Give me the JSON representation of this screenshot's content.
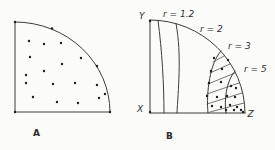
{
  "colors": {
    "background": "#fbfbf9",
    "line": "#3c3c3c",
    "dot": "#1f1f1f",
    "text": "#2b2b2b"
  },
  "figure": {
    "width": 275,
    "height": 150,
    "dot_radius": 1.2,
    "line_width": 1,
    "hatch_width": 0.7,
    "panels": [
      {
        "name": "panel-A",
        "caption": {
          "t": "A",
          "x": 33,
          "y": 136,
          "size": 9,
          "italic": false,
          "caption": true,
          "name": "panel-A-caption"
        },
        "paths": [
          {
            "name": "quarter-region-edges-A",
            "d": "M15,22 L15,112 L110,112"
          },
          {
            "name": "quarter-arc-A",
            "d": "M15,22 A95,90 0 0 1 110,112"
          }
        ],
        "hatch": [],
        "dots": [
          [
            15,
            22
          ],
          [
            52,
            28.5
          ],
          [
            97,
            66
          ],
          [
            15,
            112
          ],
          [
            110,
            112
          ],
          [
            29,
            41
          ],
          [
            44,
            44
          ],
          [
            61,
            43
          ],
          [
            30,
            57
          ],
          [
            81,
            58
          ],
          [
            62,
            64
          ],
          [
            44,
            71
          ],
          [
            26,
            75
          ],
          [
            26,
            83
          ],
          [
            53,
            84
          ],
          [
            75,
            83
          ],
          [
            97,
            85
          ],
          [
            105,
            94
          ],
          [
            33,
            97
          ],
          [
            99,
            98
          ],
          [
            57,
            102
          ],
          [
            78,
            103
          ]
        ],
        "labels": []
      },
      {
        "name": "panel-B",
        "caption": {
          "t": "B",
          "x": 166,
          "y": 139,
          "size": 9,
          "italic": false,
          "caption": true,
          "name": "panel-B-caption"
        },
        "paths": [
          {
            "name": "y-axis-B",
            "d": "M150,20 L150,113"
          },
          {
            "name": "x-axis-B",
            "d": "M150,113 L245,113"
          },
          {
            "name": "quarter-arc-B",
            "d": "M150,20 A95,93 0 0 1 245,113"
          },
          {
            "name": "contour-r-1.2",
            "d": "M158,20.5 C162,50 164,85 164,113"
          },
          {
            "name": "contour-r-2",
            "d": "M176,23.6 C182,55 178,92 177,113"
          },
          {
            "name": "contour-r-3",
            "d": "M221,51 C210,63 206,92 208,113"
          },
          {
            "name": "contour-r-5",
            "d": "M235,71 C226,81 224,101 226,113"
          }
        ],
        "hatch": [
          [
            213,
            62,
            224,
            56
          ],
          [
            210,
            73,
            230,
            64
          ],
          [
            208,
            84,
            235,
            73
          ],
          [
            207,
            94,
            239,
            83
          ],
          [
            207,
            104,
            242,
            93
          ],
          [
            210,
            112,
            244,
            103
          ]
        ],
        "dots": [
          [
            150,
            21
          ],
          [
            150,
            112
          ],
          [
            214,
            58
          ],
          [
            228,
            60
          ],
          [
            211,
            71
          ],
          [
            222,
            69
          ],
          [
            209,
            83
          ],
          [
            221,
            82
          ],
          [
            231,
            86
          ],
          [
            236,
            88
          ],
          [
            207,
            96
          ],
          [
            217,
            97
          ],
          [
            227,
            96
          ],
          [
            235,
            97
          ],
          [
            212,
            106
          ],
          [
            221,
            107
          ],
          [
            230,
            105
          ],
          [
            237,
            107
          ],
          [
            226,
            110
          ],
          [
            234,
            110
          ],
          [
            241,
            110
          ],
          [
            243,
            112
          ]
        ],
        "labels": [
          {
            "t": "Y",
            "x": 139,
            "y": 18.5,
            "size": 9,
            "italic": true,
            "name": "label-Y"
          },
          {
            "t": "X",
            "x": 137,
            "y": 112,
            "size": 9,
            "italic": true,
            "name": "label-X"
          },
          {
            "t": "Z",
            "x": 247.5,
            "y": 117,
            "size": 9,
            "italic": true,
            "name": "label-Z"
          },
          {
            "t": "r = 1.2",
            "x": 163,
            "y": 17,
            "size": 9,
            "italic": true,
            "name": "label-r-1.2"
          },
          {
            "t": "r = 2",
            "x": 200,
            "y": 32,
            "size": 9,
            "italic": true,
            "name": "label-r-2"
          },
          {
            "t": "r = 3",
            "x": 228,
            "y": 49,
            "size": 9,
            "italic": true,
            "name": "label-r-3"
          },
          {
            "t": "r = 5",
            "x": 244,
            "y": 72,
            "size": 9,
            "italic": true,
            "name": "label-r-5"
          }
        ]
      }
    ]
  }
}
